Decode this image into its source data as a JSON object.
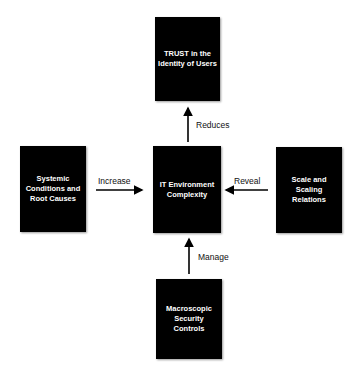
{
  "nodes": {
    "top": "TRUST in the Identity of Users",
    "left": "Systemic Conditions and Root Causes",
    "center": "IT Environment Complexity",
    "right": "Scale and Scaling Relations",
    "bottom": "Macroscopic Security Controls"
  },
  "edges": {
    "center_to_top": "Reduces",
    "left_to_center": "Increase",
    "right_to_center": "Reveal",
    "bottom_to_center": "Manage"
  }
}
